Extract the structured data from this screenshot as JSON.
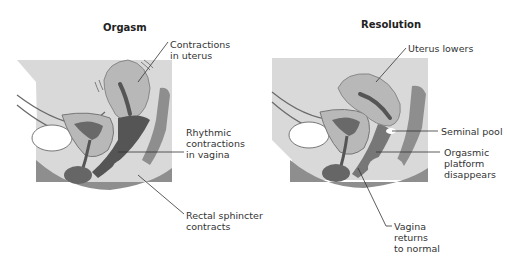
{
  "panels": [
    {
      "title": "Orgasm",
      "labels": {
        "uterus": "Contractions\nin uterus",
        "vagina": "Rhythmic\ncontractions\nin vagina",
        "rectal": "Rectal sphincter\ncontracts"
      }
    },
    {
      "title": "Resolution",
      "labels": {
        "uterus": "Uterus lowers",
        "seminal": "Seminal pool",
        "platform": "Orgasmic\nplatform\ndisappears",
        "vagina": "Vagina\nreturns\nto normal"
      }
    }
  ],
  "colors": {
    "background_box": "#d9d9d9",
    "tissue_light": "#b8b8b8",
    "tissue_mid": "#8e8e8e",
    "tissue_dark": "#555555",
    "outline": "#6a6a6a",
    "leader_line": "#333333"
  }
}
